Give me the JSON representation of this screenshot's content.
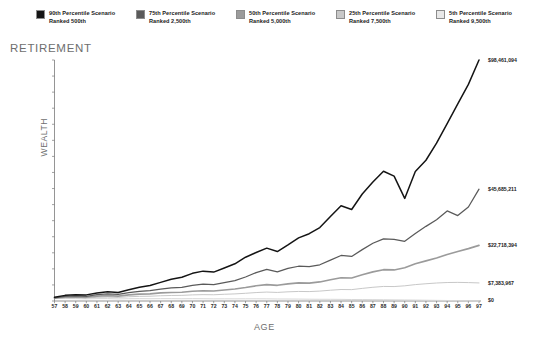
{
  "legend": {
    "items": [
      {
        "label_line1": "90th Percentile Scenario",
        "label_line2": "Ranked 500th",
        "color": "#141414"
      },
      {
        "label_line1": "75th Percentile Scenario",
        "label_line2": "Ranked 2,500th",
        "color": "#5a5a5a"
      },
      {
        "label_line1": "50th Percentile Scenario",
        "label_line2": "Ranked 5,000th",
        "color": "#9b9b9b"
      },
      {
        "label_line1": "25th Percentile Scenario",
        "label_line2": "Ranked 7,500th",
        "color": "#c8c8c8"
      },
      {
        "label_line1": "5th Percentile Scenario",
        "label_line2": "Ranked 9,500th",
        "color": "#e8e8e8"
      }
    ]
  },
  "titles": {
    "retirement": "RETIREMENT",
    "y_axis": "WEALTH",
    "x_axis": "AGE"
  },
  "end_labels": [
    {
      "text": "$98,461,094",
      "value": 98461094
    },
    {
      "text": "$45,685,211",
      "value": 45685211
    },
    {
      "text": "$22,718,394",
      "value": 22718394
    },
    {
      "text": "$7,383,967",
      "value": 7383967
    },
    {
      "text": "$0",
      "value": 0
    }
  ],
  "chart_data": {
    "type": "line",
    "title": "RETIREMENT",
    "xlabel": "AGE",
    "ylabel": "WEALTH",
    "grid": false,
    "legend_position": "top",
    "xlim": [
      57,
      97
    ],
    "ylim": [
      0,
      98461094
    ],
    "y_ticks": [
      0,
      6564072,
      13128145,
      19692218,
      26256291,
      32820364,
      39384437,
      45948510,
      52512583,
      59076656,
      65640729,
      72204802,
      78768875,
      85332948,
      91897021,
      98461094
    ],
    "y_tick_labels": [
      "$0",
      "$6,564,072",
      "$13,128,145",
      "$19,692,218",
      "$26,256,291",
      "$32,820,364",
      "$39,384,437",
      "$45,948,510",
      "$52,512,583",
      "$59,076,656",
      "$65,640,729",
      "$72,204,802",
      "$78,768,875",
      "$85,332,948",
      "$91,897,021",
      "$98,461,094"
    ],
    "x": [
      57,
      58,
      59,
      60,
      61,
      62,
      63,
      64,
      65,
      66,
      67,
      68,
      69,
      70,
      71,
      72,
      73,
      74,
      75,
      76,
      77,
      78,
      79,
      80,
      81,
      82,
      83,
      84,
      85,
      86,
      87,
      88,
      89,
      90,
      91,
      92,
      93,
      94,
      95,
      96,
      97
    ],
    "x_tick_labels": [
      "57",
      "58",
      "59",
      "60",
      "61",
      "62",
      "63",
      "64",
      "65",
      "66",
      "67",
      "68",
      "69",
      "70",
      "71",
      "72",
      "73",
      "74",
      "75",
      "76",
      "77",
      "78",
      "79",
      "80",
      "81",
      "82",
      "83",
      "84",
      "85",
      "86",
      "87",
      "88",
      "89",
      "90",
      "91",
      "92",
      "93",
      "94",
      "95",
      "96",
      "97"
    ],
    "series": [
      {
        "name": "90th Percentile Scenario Ranked 500th",
        "color": "#141414",
        "end_label": "$98,461,094",
        "values": [
          1500000,
          2300000,
          2600000,
          2500000,
          3300000,
          3800000,
          3500000,
          4600000,
          5600000,
          6300000,
          7600000,
          8900000,
          9700000,
          11300000,
          12200000,
          11800000,
          13500000,
          15200000,
          17900000,
          19800000,
          21600000,
          20200000,
          22900000,
          25800000,
          27500000,
          30000000,
          34500000,
          38900000,
          37400000,
          43700000,
          48600000,
          53000000,
          51000000,
          41900000,
          52900000,
          57500000,
          64500000,
          72500000,
          80500000,
          88500000,
          98461094
        ]
      },
      {
        "name": "75th Percentile Scenario Ranked 2,500th",
        "color": "#5a5a5a",
        "end_label": "$45,685,211",
        "values": [
          1300000,
          1900000,
          2100000,
          1900000,
          2600000,
          2900000,
          2700000,
          3400000,
          3900000,
          4200000,
          4900000,
          5400000,
          5600000,
          6400000,
          6900000,
          6700000,
          7500000,
          8300000,
          9800000,
          11600000,
          12900000,
          11900000,
          13300000,
          14200000,
          14000000,
          14800000,
          16700000,
          18600000,
          18200000,
          21000000,
          23600000,
          25400000,
          25200000,
          24400000,
          27600000,
          30500000,
          33200000,
          36800000,
          34900000,
          38400000,
          45685211
        ]
      },
      {
        "name": "50th Percentile Scenario Ranked 5,000th",
        "color": "#9b9b9b",
        "end_label": "$22,718,394",
        "values": [
          1200000,
          1600000,
          1700000,
          1500000,
          2000000,
          2200000,
          2000000,
          2500000,
          2800000,
          2900000,
          3300000,
          3500000,
          3600000,
          4000000,
          4200000,
          4100000,
          4500000,
          4900000,
          5500000,
          6200000,
          6700000,
          6400000,
          7000000,
          7400000,
          7300000,
          7800000,
          8700000,
          9500000,
          9400000,
          10700000,
          11900000,
          12800000,
          12700000,
          13600000,
          15200000,
          16400000,
          17600000,
          19000000,
          20200000,
          21400000,
          22718394
        ]
      },
      {
        "name": "25th Percentile Scenario Ranked 7,500th",
        "color": "#c8c8c8",
        "end_label": "$7,383,967",
        "values": [
          1100000,
          1300000,
          1350000,
          1200000,
          1500000,
          1600000,
          1450000,
          1750000,
          1900000,
          1950000,
          2150000,
          2250000,
          2300000,
          2500000,
          2600000,
          2550000,
          2750000,
          2900000,
          3150000,
          3450000,
          3650000,
          3500000,
          3750000,
          3900000,
          3850000,
          4050000,
          4400000,
          4700000,
          4650000,
          5150000,
          5600000,
          5950000,
          5900000,
          6200000,
          6700000,
          7050000,
          7350000,
          7550000,
          7600000,
          7520000,
          7383967
        ]
      },
      {
        "name": "5th Percentile Scenario Ranked 9,500th",
        "color": "#d8d8d8",
        "end_label": "$0",
        "values": [
          1000000,
          1050000,
          1000000,
          880000,
          980000,
          980000,
          860000,
          940000,
          960000,
          930000,
          960000,
          950000,
          920000,
          950000,
          930000,
          880000,
          890000,
          880000,
          890000,
          900000,
          880000,
          820000,
          810000,
          780000,
          730000,
          700000,
          690000,
          660000,
          600000,
          590000,
          560000,
          520000,
          470000,
          420000,
          380000,
          320000,
          260000,
          200000,
          140000,
          70000,
          0
        ]
      }
    ]
  }
}
